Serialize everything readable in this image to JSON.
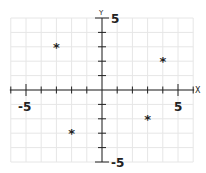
{
  "chart_data": {
    "type": "scatter",
    "title": "",
    "xlabel": "X",
    "ylabel": "Y",
    "xlim": [
      -6,
      6
    ],
    "ylim": [
      -5,
      5
    ],
    "grid": true,
    "x_tick_labels": [
      "-5",
      "5"
    ],
    "y_tick_labels": [
      "5",
      "-5"
    ],
    "marker": "*",
    "points": [
      {
        "x": -3,
        "y": 3
      },
      {
        "x": 4,
        "y": 2
      },
      {
        "x": 3,
        "y": -2
      },
      {
        "x": -2,
        "y": -3
      }
    ]
  },
  "labels": {
    "x_axis": "X",
    "y_axis": "Y",
    "x_min": "-5",
    "x_max": "5",
    "y_max": "5",
    "y_min": "-5"
  },
  "colors": {
    "grid": "#e6e6e6",
    "axis": "#222222",
    "marker": "#222222"
  }
}
